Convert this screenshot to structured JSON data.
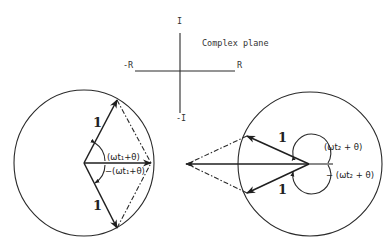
{
  "complex_plane": {
    "title": "Complex plane",
    "axis_labels": {
      "pos_imag": "I",
      "neg_imag": "-I",
      "neg_real": "-R",
      "pos_real": "R"
    }
  },
  "left_phasor": {
    "upper_magnitude": "1",
    "lower_magnitude": "1",
    "upper_angle": "(ωt₁+θ)",
    "lower_angle": "−(ωt₁+θ)"
  },
  "right_phasor": {
    "upper_magnitude": "1",
    "lower_magnitude": "1",
    "upper_angle": "(ωt₂ + θ)",
    "lower_angle": "− (ωt₂ + θ)"
  },
  "colors": {
    "ink": "#222222",
    "background": "#ffffff"
  }
}
